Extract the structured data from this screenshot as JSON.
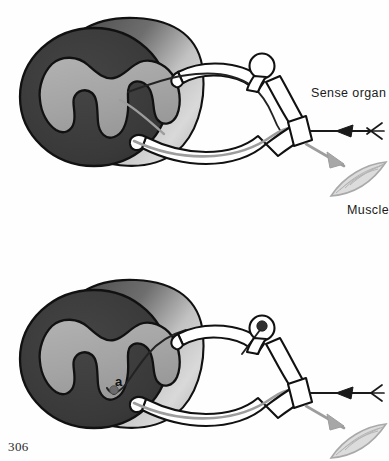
{
  "figure": {
    "page_number": "306",
    "panels": [
      {
        "id": "upper-panel",
        "name": "simple-reflex-arc",
        "description": "Spinal cord segment with dorsal root ganglion, sensory fibre to sense organ and motor fibre to muscle",
        "labels": [
          {
            "name": "sense-organ",
            "text": "Sense organ"
          },
          {
            "name": "muscle",
            "text": "Muscle"
          }
        ]
      },
      {
        "id": "lower-panel",
        "name": "reflex-arc-with-synapse",
        "description": "Same arrangement with sensory fibre terminating at point a in the grey matter",
        "labels": [
          {
            "name": "point-a",
            "text": "a"
          }
        ]
      }
    ],
    "labels": {
      "sense_organ": "Sense organ",
      "muscle": "Muscle",
      "point_a": "a",
      "page_number": "306"
    },
    "colors": {
      "white_matter_dark": "#3a3a3a",
      "grey_matter_light": "#a6a6a6",
      "cord_segment_gradient_dark": "#4e4e4e",
      "cord_segment_gradient_light": "#d6d6d6",
      "outline": "#111111",
      "sensory_fibre": "#1a1a1a",
      "motor_fibre": "#9d9d9d",
      "background": "#ffffff",
      "label_text": "#1b1b1b"
    }
  }
}
